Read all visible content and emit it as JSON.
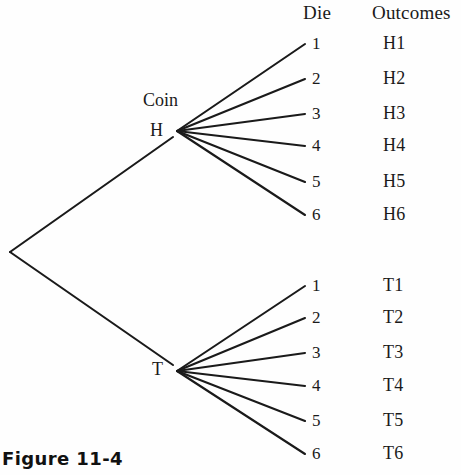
{
  "figure": {
    "caption": "Figure 11-4",
    "line_color": "#1a1a1a",
    "text_color": "#1a1a1a",
    "background": "#fefefe"
  },
  "headers": {
    "die": "Die",
    "outcomes": "Outcomes"
  },
  "stage_labels": {
    "coin": "Coin"
  },
  "nodes": [
    {
      "label": "H",
      "x": 157,
      "y": 131
    },
    {
      "label": "T",
      "x": 158,
      "y": 370
    }
  ],
  "branches": [
    {
      "node": "H",
      "die": [
        "1",
        "2",
        "3",
        "4",
        "5",
        "6"
      ],
      "outcomes": [
        "H1",
        "H2",
        "H3",
        "H4",
        "H5",
        "H6"
      ],
      "die_y": [
        48,
        83,
        118,
        150,
        186,
        219
      ],
      "outcome_y": [
        48,
        83,
        118,
        150,
        186,
        219
      ]
    },
    {
      "node": "T",
      "die": [
        "1",
        "2",
        "3",
        "4",
        "5",
        "6"
      ],
      "outcomes": [
        "T1",
        "T2",
        "T3",
        "T4",
        "T5",
        "T6"
      ],
      "die_y": [
        290,
        322,
        357,
        390,
        425,
        458
      ],
      "outcome_y": [
        290,
        322,
        357,
        390,
        425,
        458
      ]
    }
  ],
  "geometry": {
    "root": {
      "x": 10,
      "y": 252
    },
    "h_vertex": {
      "x": 177,
      "y": 131
    },
    "t_vertex": {
      "x": 177,
      "y": 371
    },
    "die_x": 305,
    "die_text_x": 312,
    "outcome_text_x": 383
  }
}
